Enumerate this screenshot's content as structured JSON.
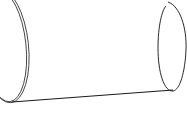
{
  "image": {
    "subject": "cylinder-tube-line-drawing",
    "background": "#ffffff",
    "stroke_color": "#2a2a2a"
  }
}
